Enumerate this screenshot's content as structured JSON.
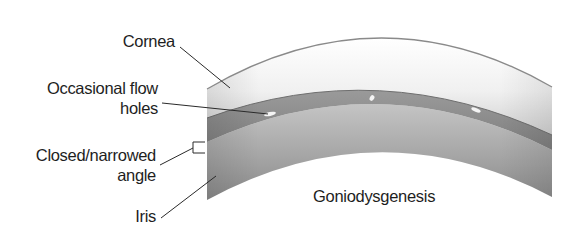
{
  "diagram": {
    "labels": {
      "cornea": "Cornea",
      "flow_holes_line1": "Occasional flow",
      "flow_holes_line2": "holes",
      "angle_line1": "Closed/narrowed",
      "angle_line2": "angle",
      "iris": "Iris",
      "caption": "Goniodysgenesis"
    },
    "colors": {
      "background": "#ffffff",
      "cornea_outline": "#8a8a8a",
      "cornea_fill_top": "#ffffff",
      "cornea_fill_bottom": "#d2d2d2",
      "trabecular_band": "#8c8c8c",
      "iris_top": "#b4b4b4",
      "iris_bottom": "#8e8e8e",
      "leader_lines": "#2a2a2a",
      "text": "#1e1e1e"
    }
  }
}
